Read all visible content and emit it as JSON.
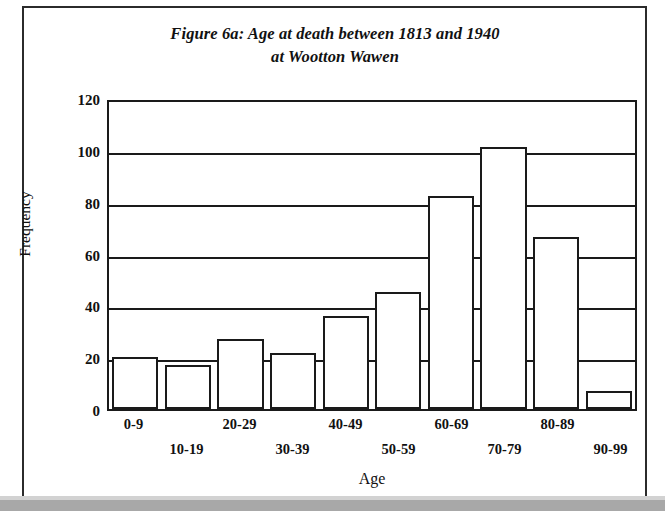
{
  "figure": {
    "title_line_1": "Figure 6a: Age at death between 1813 and 1940",
    "title_line_2": "at Wootton Wawen"
  },
  "chart_data": {
    "type": "bar",
    "title": "Figure 6a: Age at death between 1813 and 1940 at Wootton Wawen",
    "xlabel": "Age",
    "ylabel": "Frequency",
    "categories": [
      "0-9",
      "10-19",
      "20-29",
      "30-39",
      "40-49",
      "50-59",
      "60-69",
      "70-79",
      "80-89",
      "90-99"
    ],
    "values": [
      20,
      17,
      27,
      21.5,
      36,
      45,
      82,
      101,
      66.5,
      7
    ],
    "ylim": [
      0,
      120
    ],
    "ytick_labels": [
      "120",
      "100",
      "80",
      "60",
      "40",
      "20",
      "0"
    ],
    "ytick_values": [
      120,
      100,
      80,
      60,
      40,
      20,
      0
    ],
    "grid": true,
    "legend": "none",
    "bar_fill_color": "#ffffff",
    "bar_edge_color": "#1a1a1a"
  },
  "colors": {
    "ink": "#1a1a1a",
    "page": "#ffffff",
    "scan_edge": "#a8a8a8"
  }
}
